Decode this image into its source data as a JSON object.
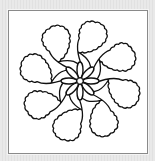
{
  "image": {
    "subject": "flower-outline-line-art",
    "petal_count": 8,
    "inner_petal_count": 8,
    "colors": {
      "background": "#e6e6e6",
      "frame_fill": "#ffffff",
      "frame_border": "#8a8a8a",
      "stroke": "#111111"
    }
  }
}
